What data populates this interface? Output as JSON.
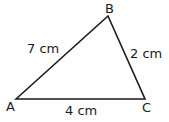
{
  "diagram": {
    "type": "triangle",
    "vertices": [
      {
        "label": "A",
        "x": 16,
        "y": 99
      },
      {
        "label": "B",
        "x": 108,
        "y": 16
      },
      {
        "label": "C",
        "x": 145,
        "y": 99
      }
    ],
    "sides": [
      {
        "from": "A",
        "to": "B",
        "label": "7 cm"
      },
      {
        "from": "B",
        "to": "C",
        "label": "2 cm"
      },
      {
        "from": "A",
        "to": "C",
        "label": "4 cm"
      }
    ],
    "stroke_color": "#1a1a1a"
  }
}
